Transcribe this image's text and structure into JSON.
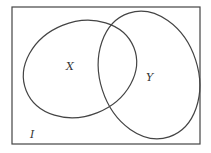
{
  "diagram": {
    "type": "venn",
    "universe_label": "I",
    "sets": [
      {
        "name": "X",
        "label": "X"
      },
      {
        "name": "Y",
        "label": "Y"
      }
    ],
    "colors": {
      "stroke": "#444444",
      "background": "#ffffff"
    }
  }
}
